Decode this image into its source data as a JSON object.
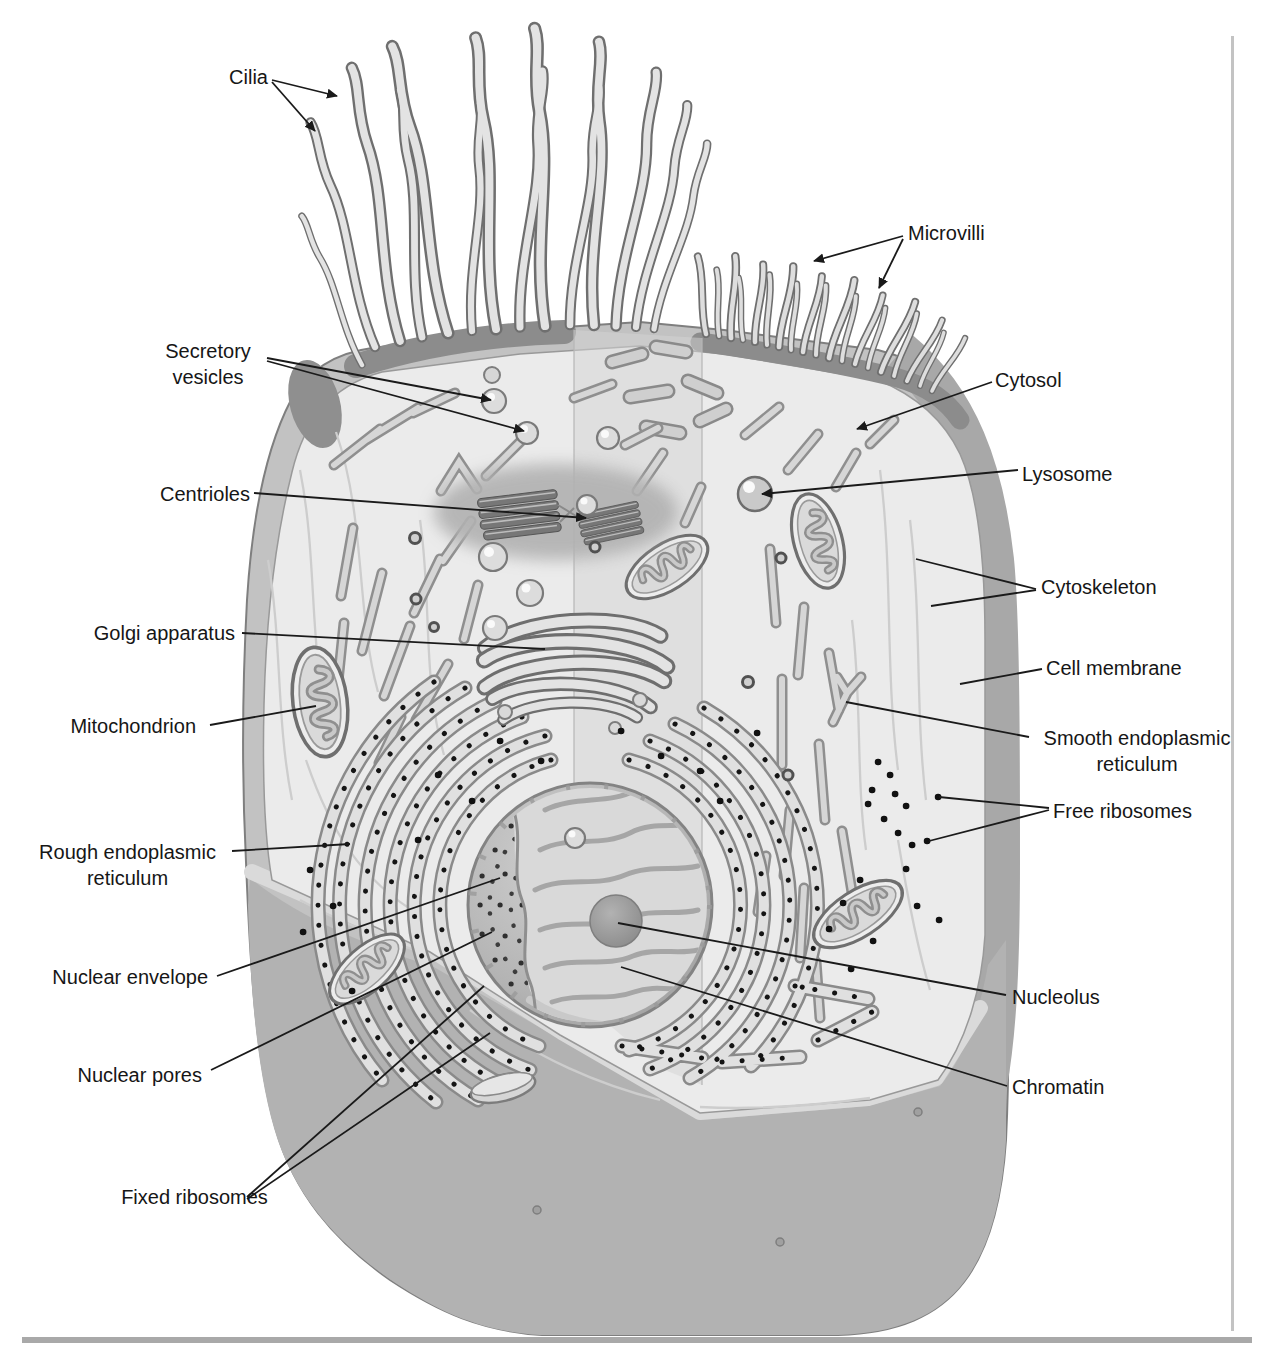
{
  "labels": [
    {
      "id": "cilia",
      "text": "Cilia"
    },
    {
      "id": "microvilli",
      "text": "Microvilli"
    },
    {
      "id": "secretory-vesicles",
      "text": "Secretory vesicles"
    },
    {
      "id": "cytosol",
      "text": "Cytosol"
    },
    {
      "id": "centrioles",
      "text": "Centrioles"
    },
    {
      "id": "lysosome",
      "text": "Lysosome"
    },
    {
      "id": "cytoskeleton",
      "text": "Cytoskeleton"
    },
    {
      "id": "golgi-apparatus",
      "text": "Golgi apparatus"
    },
    {
      "id": "cell-membrane",
      "text": "Cell membrane"
    },
    {
      "id": "mitochondrion",
      "text": "Mitochondrion"
    },
    {
      "id": "smooth-endoplasmic-reticulum",
      "text": "Smooth endoplasmic reticulum"
    },
    {
      "id": "free-ribosomes",
      "text": "Free ribosomes"
    },
    {
      "id": "rough-endoplasmic-reticulum",
      "text": "Rough endoplasmic reticulum"
    },
    {
      "id": "nuclear-envelope",
      "text": "Nuclear envelope"
    },
    {
      "id": "nuclear-pores",
      "text": "Nuclear pores"
    },
    {
      "id": "fixed-ribosomes",
      "text": "Fixed ribosomes"
    },
    {
      "id": "nucleolus",
      "text": "Nucleolus"
    },
    {
      "id": "chromatin",
      "text": "Chromatin"
    }
  ],
  "colors": {
    "background": "#ffffff",
    "leader_line": "#1a1a1a",
    "label_text": "#161616",
    "cell_interior": "#ebebeb",
    "cell_rim": "#c2c2c2",
    "membrane_band": "#a8a8a8",
    "cut_base": "#b2b2b2",
    "apical_band": "#8c8c8c",
    "ribosome_dot": "#111111"
  }
}
